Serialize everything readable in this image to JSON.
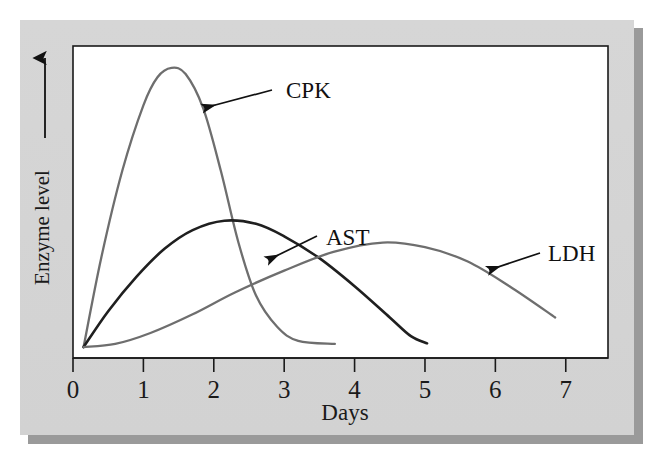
{
  "figure": {
    "panel_color": "#d4d4d4",
    "shadow_color": "#9a9a9a",
    "plot_background": "#ffffff",
    "frame_color": "#1a1a1a"
  },
  "chart_data": {
    "type": "line",
    "title": "",
    "subtitle": "",
    "xlabel": "Days",
    "ylabel": "Enzyme level",
    "xlim": [
      0,
      7.6
    ],
    "ylim": [
      0,
      1.0
    ],
    "xticks": [
      0,
      1,
      2,
      3,
      4,
      5,
      6,
      7
    ],
    "xticklabels": [
      "0",
      "1",
      "2",
      "3",
      "4",
      "5",
      "6",
      "7"
    ],
    "yticks": [],
    "yticklabels": [],
    "grid": false,
    "legend": "annotations",
    "y_axis_arrow": true,
    "annotations": [
      {
        "text": "CPK",
        "label_x": 286,
        "label_y": 78,
        "arrow_from_x": 272,
        "arrow_from_y": 90,
        "arrow_to_x": 204,
        "arrow_to_y": 108
      },
      {
        "text": "AST",
        "label_x": 326,
        "label_y": 225,
        "arrow_from_x": 317,
        "arrow_from_y": 236,
        "arrow_to_x": 268,
        "arrow_to_y": 260
      },
      {
        "text": "LDH",
        "label_x": 548,
        "label_y": 241,
        "arrow_from_x": 540,
        "arrow_from_y": 253,
        "arrow_to_x": 489,
        "arrow_to_y": 270
      }
    ],
    "series": [
      {
        "name": "CPK",
        "color": "#6e6e6e",
        "linewidth": 2.3,
        "peak_day": 1.4,
        "peak_value": 0.93,
        "start_day": 0.15,
        "end_day": 3.72,
        "points": [
          {
            "day": 0.15,
            "value": 0.035
          },
          {
            "day": 0.4,
            "value": 0.32
          },
          {
            "day": 0.7,
            "value": 0.6
          },
          {
            "day": 1.0,
            "value": 0.81
          },
          {
            "day": 1.2,
            "value": 0.9
          },
          {
            "day": 1.4,
            "value": 0.93
          },
          {
            "day": 1.6,
            "value": 0.91
          },
          {
            "day": 1.85,
            "value": 0.8
          },
          {
            "day": 2.1,
            "value": 0.6
          },
          {
            "day": 2.35,
            "value": 0.37
          },
          {
            "day": 2.6,
            "value": 0.2
          },
          {
            "day": 2.9,
            "value": 0.1
          },
          {
            "day": 3.2,
            "value": 0.055
          },
          {
            "day": 3.72,
            "value": 0.045
          }
        ]
      },
      {
        "name": "AST",
        "color": "#1f1f1f",
        "linewidth": 2.6,
        "peak_day": 2.15,
        "peak_value": 0.44,
        "start_day": 0.15,
        "end_day": 5.03,
        "points": [
          {
            "day": 0.15,
            "value": 0.035
          },
          {
            "day": 0.5,
            "value": 0.15
          },
          {
            "day": 0.9,
            "value": 0.26
          },
          {
            "day": 1.3,
            "value": 0.35
          },
          {
            "day": 1.7,
            "value": 0.41
          },
          {
            "day": 2.15,
            "value": 0.44
          },
          {
            "day": 2.6,
            "value": 0.43
          },
          {
            "day": 3.0,
            "value": 0.39
          },
          {
            "day": 3.5,
            "value": 0.32
          },
          {
            "day": 4.0,
            "value": 0.23
          },
          {
            "day": 4.5,
            "value": 0.13
          },
          {
            "day": 4.8,
            "value": 0.07
          },
          {
            "day": 5.03,
            "value": 0.047
          }
        ]
      },
      {
        "name": "LDH",
        "color": "#6e6e6e",
        "linewidth": 2.3,
        "peak_day": 4.4,
        "peak_value": 0.37,
        "start_day": 0.15,
        "end_day": 6.85,
        "points": [
          {
            "day": 0.15,
            "value": 0.035
          },
          {
            "day": 0.6,
            "value": 0.045
          },
          {
            "day": 1.1,
            "value": 0.08
          },
          {
            "day": 1.7,
            "value": 0.14
          },
          {
            "day": 2.3,
            "value": 0.21
          },
          {
            "day": 3.0,
            "value": 0.28
          },
          {
            "day": 3.7,
            "value": 0.34
          },
          {
            "day": 4.4,
            "value": 0.37
          },
          {
            "day": 5.0,
            "value": 0.355
          },
          {
            "day": 5.6,
            "value": 0.31
          },
          {
            "day": 6.2,
            "value": 0.23
          },
          {
            "day": 6.85,
            "value": 0.13
          }
        ]
      }
    ]
  }
}
